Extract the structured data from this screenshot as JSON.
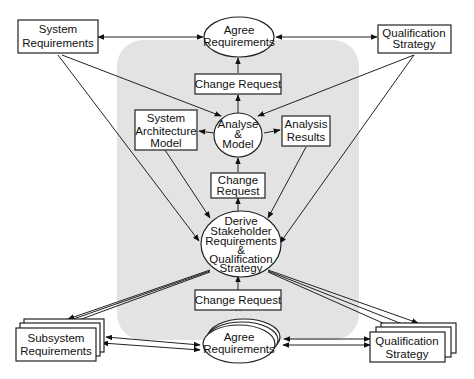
{
  "diagram": {
    "region_fill": "#e3e3e3",
    "nodes": {
      "system_requirements": [
        "System",
        "Requirements"
      ],
      "agree_requirements_top": [
        "Agree",
        "Requirements"
      ],
      "qualification_strategy_top": [
        "Qualification",
        "Strategy"
      ],
      "change_request_1": [
        "Change  Request"
      ],
      "system_architecture_model": [
        "System",
        "Architecture",
        "Model"
      ],
      "analyse_model": [
        "Analyse",
        "&",
        "Model"
      ],
      "analysis_results": [
        "Analysis",
        "Results"
      ],
      "change_request_2": [
        "Change",
        "Request"
      ],
      "derive_stakeholder": [
        "Derive",
        "Stakeholder",
        "Requirements",
        "&",
        "Qualification",
        "Strategy"
      ],
      "change_request_3": [
        "Change  Request"
      ],
      "subsystem_requirements": [
        "Subsystem",
        "Requirements"
      ],
      "agree_requirements_bottom": [
        "Agree",
        "Requirements"
      ],
      "qualification_strategy_bottom": [
        "Qualification",
        "Strategy"
      ]
    }
  }
}
